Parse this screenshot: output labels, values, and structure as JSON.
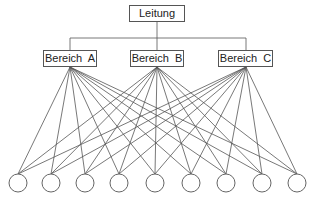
{
  "diagram": {
    "type": "organigram",
    "root": {
      "label": "Leitung"
    },
    "departments": [
      {
        "label": "Bereich  A"
      },
      {
        "label": "Bereich  B"
      },
      {
        "label": "Bereich  C"
      }
    ],
    "units": {
      "count": 9,
      "connections": "each department connects to all units"
    },
    "colors": {
      "line": "#555555",
      "background": "#ffffff"
    }
  }
}
